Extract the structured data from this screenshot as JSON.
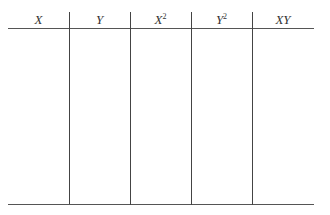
{
  "table": {
    "columns": [
      {
        "label": "X",
        "sup": ""
      },
      {
        "label": "Y",
        "sup": ""
      },
      {
        "label": "X",
        "sup": "2"
      },
      {
        "label": "Y",
        "sup": "2"
      },
      {
        "label": "XY",
        "sup": ""
      }
    ],
    "rows": []
  }
}
